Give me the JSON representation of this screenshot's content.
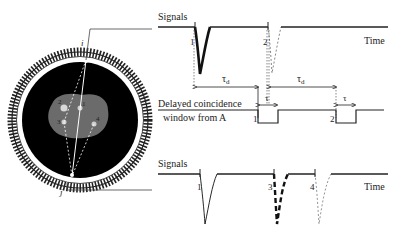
{
  "diagram": {
    "detector_ring": {
      "detector_i_label": "i",
      "detector_j_label": "j",
      "source_labels": [
        "1",
        "2",
        "3",
        "4"
      ]
    },
    "top_trace": {
      "title": "Signals",
      "axis_label": "Time",
      "pulse_labels": [
        "1",
        "2"
      ]
    },
    "window_trace": {
      "label_line1": "Delayed coincidence",
      "label_line2": "window from A",
      "window_labels": [
        "1",
        "2"
      ],
      "delay_label": "τ",
      "delay_subscript": "d",
      "width_label": "τ"
    },
    "bottom_trace": {
      "title": "Signals",
      "axis_label": "Time",
      "pulse_labels": [
        "1",
        "3",
        "4"
      ]
    },
    "colors": {
      "line": "#222222",
      "ring_fill": "#ffffff",
      "ring_inner": "#000000",
      "body": "#6b6b6b"
    }
  }
}
